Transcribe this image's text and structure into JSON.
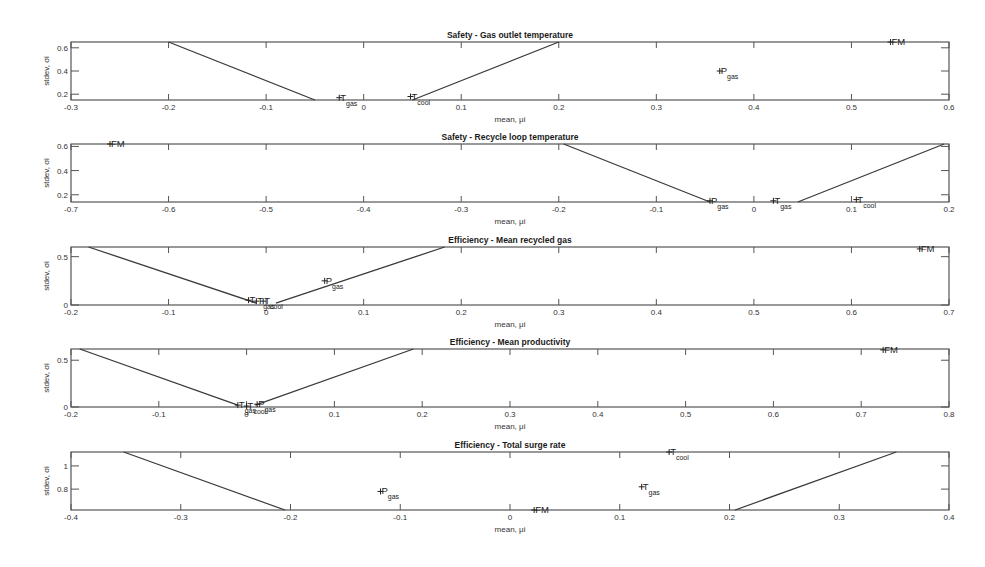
{
  "figure": {
    "panels_count": 5,
    "line_color": "#3a3a3a",
    "frame_color": "#555555"
  },
  "chart_data": [
    {
      "type": "scatter",
      "title": "Safety - Gas outlet temperature",
      "xlabel": "mean, μi",
      "ylabel": "stdev, σi",
      "xlim": [
        -0.3,
        0.6
      ],
      "ylim": [
        0.15,
        0.65
      ],
      "xticks": [
        "-0.3",
        "-0.2",
        "-0.1",
        "0",
        "0.1",
        "0.2",
        "0.3",
        "0.4",
        "0.5",
        "0.6"
      ],
      "yticks": [
        "0.2",
        "0.4",
        "0.6"
      ],
      "ytick_values": [
        0.2,
        0.4,
        0.6
      ],
      "grid": false,
      "boundary_lines": [
        {
          "x": [
            -0.2,
            -0.05
          ],
          "y": [
            0.65,
            0.15
          ]
        },
        {
          "x": [
            0.05,
            0.2
          ],
          "y": [
            0.15,
            0.65
          ]
        }
      ],
      "points": [
        {
          "label": "T",
          "sub": "gas",
          "x": -0.025,
          "y": 0.17
        },
        {
          "label": "T",
          "sub": "cool",
          "x": 0.048,
          "y": 0.18
        },
        {
          "label": "P",
          "sub": "gas",
          "x": 0.365,
          "y": 0.4
        },
        {
          "label": "FM",
          "sub": "",
          "x": 0.54,
          "y": 0.65
        }
      ]
    },
    {
      "type": "scatter",
      "title": "Safety - Recycle loop temperature",
      "xlabel": "mean, μi",
      "ylabel": "stdev, σi",
      "xlim": [
        -0.7,
        0.2
      ],
      "ylim": [
        0.14,
        0.62
      ],
      "xticks": [
        "-0.7",
        "-0.6",
        "-0.5",
        "-0.4",
        "-0.3",
        "-0.2",
        "-0.1",
        "0",
        "0.1",
        "0.2"
      ],
      "yticks": [
        "0.2",
        "0.4",
        "0.6"
      ],
      "ytick_values": [
        0.2,
        0.4,
        0.6
      ],
      "grid": false,
      "boundary_lines": [
        {
          "x": [
            -0.195,
            -0.045
          ],
          "y": [
            0.62,
            0.14
          ]
        },
        {
          "x": [
            0.045,
            0.195
          ],
          "y": [
            0.14,
            0.62
          ]
        }
      ],
      "points": [
        {
          "label": "FM",
          "sub": "",
          "x": -0.66,
          "y": 0.62
        },
        {
          "label": "P",
          "sub": "gas",
          "x": -0.045,
          "y": 0.15
        },
        {
          "label": "T",
          "sub": "gas",
          "x": 0.02,
          "y": 0.15
        },
        {
          "label": "T",
          "sub": "cool",
          "x": 0.105,
          "y": 0.16
        }
      ]
    },
    {
      "type": "scatter",
      "title": "Efficiency - Mean recycled gas",
      "xlabel": "mean, μi",
      "ylabel": "stdev, σi",
      "xlim": [
        -0.2,
        0.7
      ],
      "ylim": [
        0,
        0.6
      ],
      "xticks": [
        "-0.2",
        "-0.1",
        "0",
        "0.1",
        "0.2",
        "0.3",
        "0.4",
        "0.5",
        "0.6",
        "0.7"
      ],
      "yticks": [
        "0",
        "0.5"
      ],
      "ytick_values": [
        0,
        0.5
      ],
      "grid": false,
      "boundary_lines": [
        {
          "x": [
            -0.182,
            -0.01
          ],
          "y": [
            0.6,
            0.02
          ]
        },
        {
          "x": [
            0.01,
            0.183
          ],
          "y": [
            0.02,
            0.6
          ]
        }
      ],
      "points": [
        {
          "label": "T",
          "sub": "",
          "x": -0.018,
          "y": 0.05
        },
        {
          "label": "T",
          "sub": "gas",
          "x": -0.01,
          "y": 0.04
        },
        {
          "label": "T",
          "sub": "cool",
          "x": -0.003,
          "y": 0.04
        },
        {
          "label": "P",
          "sub": "gas",
          "x": 0.06,
          "y": 0.25
        },
        {
          "label": "FM",
          "sub": "",
          "x": 0.67,
          "y": 0.58
        }
      ]
    },
    {
      "type": "scatter",
      "title": "Efficiency - Mean productivity",
      "xlabel": "mean, μi",
      "ylabel": "stdev, σi",
      "xlim": [
        -0.2,
        0.8
      ],
      "ylim": [
        0,
        0.62
      ],
      "xticks": [
        "-0.2",
        "-0.1",
        "0",
        "0.1",
        "0.2",
        "0.3",
        "0.4",
        "0.5",
        "0.6",
        "0.7",
        "0.8"
      ],
      "yticks": [
        "0",
        "0.5"
      ],
      "ytick_values": [
        0,
        0.5
      ],
      "grid": false,
      "boundary_lines": [
        {
          "x": [
            -0.19,
            -0.01
          ],
          "y": [
            0.62,
            0.02
          ]
        },
        {
          "x": [
            0.01,
            0.19
          ],
          "y": [
            0.02,
            0.62
          ]
        }
      ],
      "points": [
        {
          "label": "T",
          "sub": "gas",
          "x": -0.01,
          "y": 0.02
        },
        {
          "label": "T",
          "sub": "cool",
          "x": 0.0,
          "y": 0.01
        },
        {
          "label": "P",
          "sub": "gas",
          "x": 0.012,
          "y": 0.03
        },
        {
          "label": "FM",
          "sub": "",
          "x": 0.725,
          "y": 0.61
        }
      ]
    },
    {
      "type": "scatter",
      "title": "Efficiency - Total surge rate",
      "xlabel": "mean, μi",
      "ylabel": "stdev, σi",
      "xlim": [
        -0.4,
        0.4
      ],
      "ylim": [
        0.62,
        1.12
      ],
      "xticks": [
        "-0.4",
        "-0.3",
        "-0.2",
        "-0.1",
        "0",
        "0.1",
        "0.2",
        "0.3",
        "0.4"
      ],
      "yticks": [
        "0.8",
        "1"
      ],
      "ytick_values": [
        0.8,
        1.0
      ],
      "grid": false,
      "boundary_lines": [
        {
          "x": [
            -0.352,
            -0.205
          ],
          "y": [
            1.12,
            0.62
          ]
        },
        {
          "x": [
            0.205,
            0.352
          ],
          "y": [
            0.62,
            1.12
          ]
        }
      ],
      "points": [
        {
          "label": "P",
          "sub": "gas",
          "x": -0.118,
          "y": 0.78
        },
        {
          "label": "T",
          "sub": "cool",
          "x": 0.145,
          "y": 1.12
        },
        {
          "label": "T",
          "sub": "gas",
          "x": 0.12,
          "y": 0.82
        },
        {
          "label": "FM",
          "sub": "",
          "x": 0.022,
          "y": 0.62
        }
      ]
    }
  ]
}
